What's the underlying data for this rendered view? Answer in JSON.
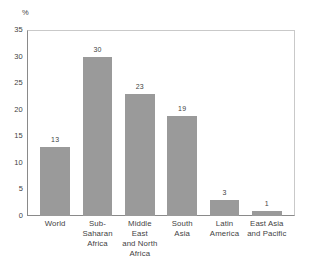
{
  "chart_data": {
    "type": "bar",
    "title": "",
    "subtitle": "",
    "xlabel": "",
    "ylabel": "%",
    "ylim": [
      0,
      35
    ],
    "yticks": [
      0,
      5,
      10,
      15,
      20,
      25,
      30,
      35
    ],
    "ytick_labels": [
      "0",
      "5",
      "10",
      "15",
      "20",
      "25",
      "30",
      "35"
    ],
    "grid": false,
    "legend": false,
    "legend_position": "none",
    "bar_color": "#9a9a9a",
    "categories": [
      "World",
      "Sub-Saharan Africa",
      "Middle East and North Africa",
      "South Asia",
      "Latin America",
      "East Asia and Pacific"
    ],
    "category_lines": [
      [
        "World"
      ],
      [
        "Sub-",
        "Saharan",
        "Africa"
      ],
      [
        "Middle East",
        "and North",
        "Africa"
      ],
      [
        "South",
        "Asia"
      ],
      [
        "Latin",
        "America"
      ],
      [
        "East Asia",
        "and Pacific"
      ]
    ],
    "values": [
      13,
      30,
      23,
      19,
      3,
      1
    ],
    "value_labels": [
      "13",
      "30",
      "23",
      "19",
      "3",
      "1"
    ]
  }
}
